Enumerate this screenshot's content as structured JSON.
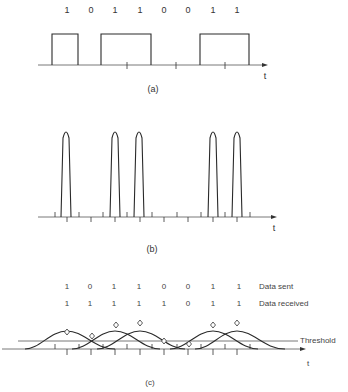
{
  "figure": {
    "bit_period_px": 24.4,
    "bit_centers_x": [
      67,
      91,
      115,
      140,
      164,
      188,
      213,
      237
    ],
    "panel_a": {
      "label": "(a)",
      "axis_label": "t",
      "bits": [
        "1",
        "0",
        "1",
        "1",
        "0",
        "0",
        "1",
        "1"
      ],
      "description": "NRZ rectangular pulse train"
    },
    "panel_b": {
      "label": "(b)",
      "axis_label": "t",
      "pulse_bit_indices": [
        0,
        2,
        3,
        6,
        7
      ],
      "description": "Narrow return-to-zero pulses for 1 bits"
    },
    "panel_c": {
      "label": "(c)",
      "axis_label": "t",
      "threshold_label": "Threshold",
      "rows": [
        {
          "name": "Data sent",
          "bits": [
            "1",
            "0",
            "1",
            "1",
            "0",
            "0",
            "1",
            "1"
          ]
        },
        {
          "name": "Data received",
          "bits": [
            "1",
            "1",
            "1",
            "1",
            "1",
            "0",
            "1",
            "1"
          ]
        }
      ],
      "description": "Broadened overlapping pulses (intersymbol interference) sampled against a threshold"
    }
  }
}
